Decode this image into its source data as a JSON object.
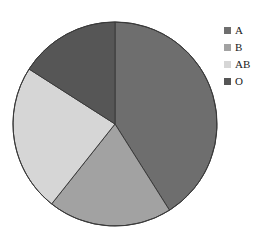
{
  "chart": {
    "title": "",
    "title_visible_fragment": ""
  },
  "legend": {
    "position": "right",
    "items": [
      {
        "label": "A",
        "color": "#6e6e6e"
      },
      {
        "label": "B",
        "color": "#a2a2a2"
      },
      {
        "label": "AB",
        "color": "#d6d6d6"
      },
      {
        "label": "O",
        "color": "#565656"
      }
    ]
  },
  "chart_data": {
    "type": "pie",
    "title": "",
    "xlabel": "",
    "ylabel": "",
    "categories": [
      "A",
      "B",
      "AB",
      "O"
    ],
    "values": [
      41,
      20,
      23,
      16
    ],
    "unit": "percent",
    "start_angle_deg": 0,
    "direction": "clockwise",
    "slice_boundaries_deg": [
      0,
      147.7,
      218.4,
      302.6,
      360
    ],
    "colors": [
      "#6e6e6e",
      "#a2a2a2",
      "#d6d6d6",
      "#565656"
    ],
    "stroke_color": "#3a3a3a",
    "grid": false,
    "legend": [
      "A",
      "B",
      "AB",
      "O"
    ],
    "legend_position": "right",
    "annotations": []
  },
  "geometry": {
    "center_x": 115,
    "center_y": 124,
    "radius": 102
  }
}
